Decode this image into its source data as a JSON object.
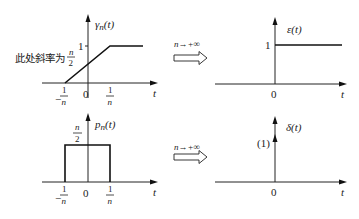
{
  "panels": {
    "top_left": {
      "function_label": "γ",
      "function_sub": "n",
      "function_arg": "(t)",
      "level_label": "1",
      "annotation_text": "此处斜率为",
      "annotation_frac_num": "n",
      "annotation_frac_den": "2",
      "x_axis_label": "t",
      "ticks": [
        {
          "sign": "−",
          "num": "1",
          "den": "n"
        },
        {
          "label": "0"
        },
        {
          "num": "1",
          "den": "n"
        }
      ]
    },
    "top_right": {
      "function_label": "ε(t)",
      "level_label": "1",
      "origin_label": "0",
      "x_axis_label": "t"
    },
    "bottom_left": {
      "function_label": "p",
      "function_sub": "n",
      "function_arg": "(t)",
      "height_num": "n",
      "height_den": "2",
      "x_axis_label": "t",
      "ticks": [
        {
          "sign": "−",
          "num": "1",
          "den": "n"
        },
        {
          "label": "0"
        },
        {
          "num": "1",
          "den": "n"
        }
      ]
    },
    "bottom_right": {
      "function_label": "δ(t)",
      "impulse_weight": "(1)",
      "origin_label": "0",
      "x_axis_label": "t"
    }
  },
  "transitions": {
    "top": {
      "n": "n",
      "arrow": "→",
      "limit": "+∞"
    },
    "bottom": {
      "n": "n",
      "arrow": "→",
      "limit": "+∞"
    }
  }
}
